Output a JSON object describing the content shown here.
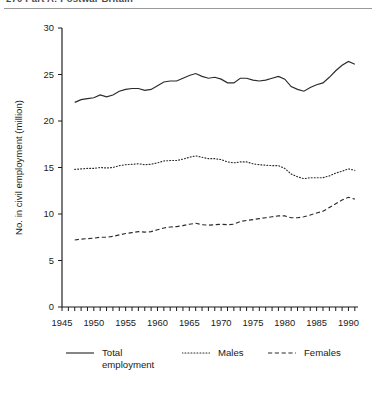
{
  "page": {
    "running_head": "270   Part A: Postwar Britain"
  },
  "chart_data": {
    "type": "line",
    "title": "",
    "xlabel": "",
    "ylabel": "No. in civil employment (million)",
    "xlim": [
      1945,
      1991.5
    ],
    "ylim": [
      0,
      30
    ],
    "yticks": [
      0,
      5,
      10,
      15,
      20,
      25,
      30
    ],
    "xticks": [
      1945,
      1950,
      1955,
      1960,
      1965,
      1970,
      1975,
      1980,
      1985,
      1990
    ],
    "xtick_labels": [
      "1945",
      "1950",
      "1955",
      "1960",
      "1965",
      "1970",
      "1975",
      "1980",
      "1985",
      "1990"
    ],
    "ytick_labels": [
      "0",
      "5",
      "10",
      "15",
      "20",
      "25",
      "30"
    ],
    "minor_xticks_every": 1,
    "grid": false,
    "legend_position": "below",
    "x": [
      1947,
      1948,
      1949,
      1950,
      1951,
      1952,
      1953,
      1954,
      1955,
      1956,
      1957,
      1958,
      1959,
      1960,
      1961,
      1962,
      1963,
      1964,
      1965,
      1966,
      1967,
      1968,
      1969,
      1970,
      1971,
      1972,
      1973,
      1974,
      1975,
      1976,
      1977,
      1978,
      1979,
      1980,
      1981,
      1982,
      1983,
      1984,
      1985,
      1986,
      1987,
      1988,
      1989,
      1990,
      1991
    ],
    "series": [
      {
        "name": "Total employment",
        "style": "solid",
        "color": "#2b2b2b",
        "values": [
          22.0,
          22.3,
          22.4,
          22.5,
          22.8,
          22.6,
          22.8,
          23.2,
          23.4,
          23.5,
          23.5,
          23.3,
          23.4,
          23.8,
          24.2,
          24.3,
          24.3,
          24.6,
          24.9,
          25.1,
          24.8,
          24.6,
          24.7,
          24.5,
          24.1,
          24.1,
          24.6,
          24.6,
          24.4,
          24.3,
          24.4,
          24.6,
          24.8,
          24.5,
          23.7,
          23.4,
          23.2,
          23.6,
          23.9,
          24.1,
          24.7,
          25.4,
          26.0,
          26.4,
          26.1
        ]
      },
      {
        "name": "Males",
        "style": "dotted",
        "color": "#2b2b2b",
        "values": [
          14.8,
          14.85,
          14.9,
          14.9,
          15.0,
          14.95,
          15.0,
          15.2,
          15.3,
          15.35,
          15.4,
          15.3,
          15.35,
          15.5,
          15.7,
          15.75,
          15.75,
          15.9,
          16.1,
          16.25,
          16.1,
          15.95,
          15.95,
          15.85,
          15.6,
          15.5,
          15.6,
          15.6,
          15.4,
          15.3,
          15.25,
          15.2,
          15.2,
          14.9,
          14.3,
          14.0,
          13.8,
          13.9,
          13.9,
          13.9,
          14.1,
          14.4,
          14.6,
          14.85,
          14.7
        ]
      },
      {
        "name": "Females",
        "style": "dashed",
        "color": "#2b2b2b",
        "values": [
          7.2,
          7.3,
          7.35,
          7.4,
          7.5,
          7.5,
          7.6,
          7.75,
          7.9,
          8.0,
          8.1,
          8.05,
          8.1,
          8.3,
          8.5,
          8.6,
          8.65,
          8.75,
          8.9,
          9.0,
          8.85,
          8.8,
          8.85,
          8.9,
          8.85,
          8.9,
          9.2,
          9.3,
          9.4,
          9.5,
          9.6,
          9.7,
          9.8,
          9.8,
          9.6,
          9.6,
          9.7,
          9.9,
          10.1,
          10.3,
          10.7,
          11.1,
          11.5,
          11.8,
          11.6
        ]
      }
    ]
  },
  "legend": {
    "items": [
      {
        "label": "Total\nemployment",
        "style": "solid"
      },
      {
        "label": "Males",
        "style": "dotted"
      },
      {
        "label": "Females",
        "style": "dashed"
      }
    ]
  }
}
